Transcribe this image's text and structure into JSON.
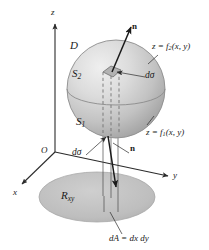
{
  "figure": {
    "background_color": "#ffffff",
    "width": 209,
    "height": 250
  },
  "axes": {
    "origin_label": "O",
    "z_label": "z",
    "x_label": "x",
    "y_label": "y",
    "axis_color": "#2b2b2b"
  },
  "labels": {
    "region_D": "D",
    "upper_surface": "S",
    "upper_surface_sub": "2",
    "lower_surface": "S",
    "lower_surface_sub": "1",
    "projection_region": "R",
    "projection_region_sub": "xy",
    "normal_top": "n",
    "normal_bottom": "n",
    "d_sigma_top": "dσ",
    "d_sigma_bottom": "dσ",
    "eq_upper_lhs": "z = f",
    "eq_upper_sub": "2",
    "eq_upper_rhs": "(x, y)",
    "eq_lower_lhs": "z = f",
    "eq_lower_sub": "1",
    "eq_lower_rhs": "(x, y)",
    "area_element_lhs": "dA = dx dy"
  },
  "colors": {
    "sphere_fill_light": "#e3e3e3",
    "sphere_fill_mid": "#c9c9c9",
    "sphere_fill_dark": "#a9a9a9",
    "sphere_outline": "#8d8d8d",
    "ellipse_fill": "#c0c0c0",
    "ellipse_outline": "#a8a8a8",
    "patch_fill": "#b4b4b4",
    "line_color": "#2b2b2b",
    "dashed_color": "#6e6e6e",
    "text_color": "#1a1a1a"
  }
}
